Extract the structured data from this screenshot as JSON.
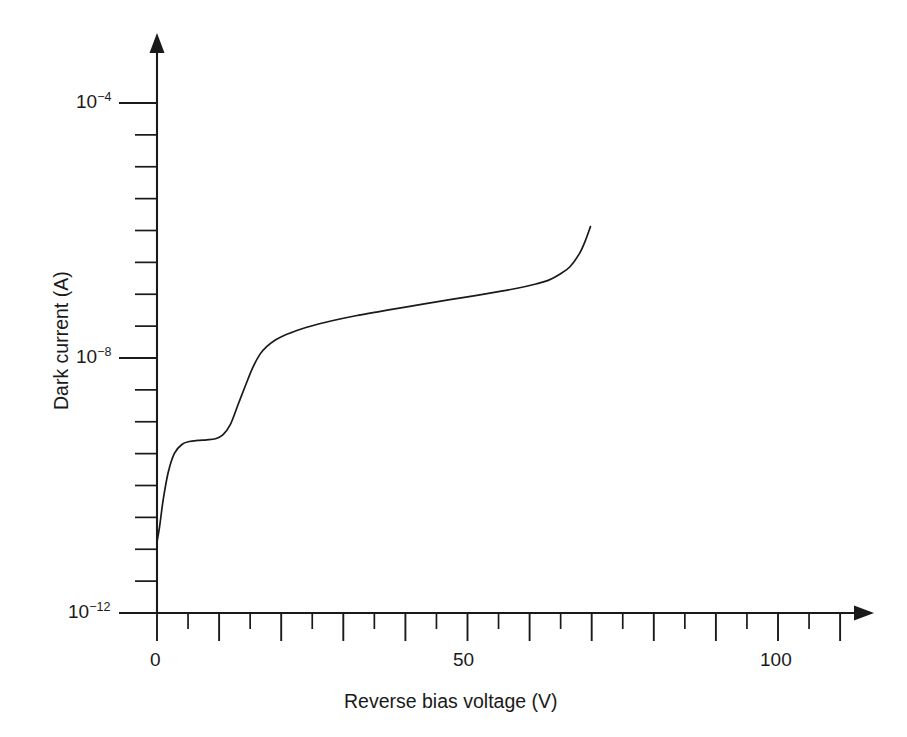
{
  "figure": {
    "background_color": "#ffffff",
    "line_color": "#1a1a1a",
    "width": 907,
    "height": 737
  },
  "chart_data": {
    "type": "line",
    "title": "",
    "subtitle": "",
    "xlabel": "Reverse bias voltage (V)",
    "ylabel": "Dark current (A)",
    "xscale": "linear",
    "yscale": "log",
    "xlim": [
      0,
      115
    ],
    "ylim": [
      1e-12,
      0.001
    ],
    "grid": false,
    "legend": null,
    "x_major_tick_labels": [
      "0",
      "50",
      "100"
    ],
    "x_major_tick_values": [
      0,
      50,
      100
    ],
    "x_tick_interval_major": 10,
    "x_tick_interval_minor": 5,
    "y_major_tick_labels": [
      "10⁻⁴",
      "10⁻⁸",
      "10⁻¹²"
    ],
    "y_major_tick_values": [
      0.0001,
      1e-08,
      1e-12
    ],
    "y_minor_tick_decades": [
      1e-05,
      1e-06,
      1e-07,
      1e-09,
      1e-10,
      1e-11
    ],
    "y_tick_per_decade": 1,
    "series": [
      {
        "name": "Dark current",
        "x": [
          0,
          0.4,
          1.0,
          1.8,
          2.8,
          4.0,
          5.2,
          6.6,
          8.0,
          9.4,
          10.6,
          11.8,
          13.0,
          14.2,
          15.4,
          16.6,
          17.8,
          19.0,
          20.2,
          21.6,
          23.0,
          25.0,
          28.0,
          32.0,
          36.0,
          40.0,
          45.0,
          50.0,
          55.0,
          58.0,
          61.0,
          63.0,
          65.0,
          66.5,
          68.0,
          69.0,
          69.8
        ],
        "y": [
          1.3e-11,
          2.2e-11,
          6e-11,
          1.6e-10,
          3.2e-10,
          4.4e-10,
          4.9e-10,
          5.1e-10,
          5.2e-10,
          5.4e-10,
          6.2e-10,
          9e-10,
          1.8e-09,
          3.6e-09,
          7e-09,
          1.15e-08,
          1.55e-08,
          1.9e-08,
          2.2e-08,
          2.5e-08,
          2.8e-08,
          3.2e-08,
          3.8e-08,
          4.6e-08,
          5.4e-08,
          6.3e-08,
          7.6e-08,
          9.1e-08,
          1.1e-07,
          1.24e-07,
          1.45e-07,
          1.65e-07,
          2.1e-07,
          2.7e-07,
          4.3e-07,
          7e-07,
          1.15e-06
        ]
      }
    ]
  },
  "axis_labels": {
    "x_title": "Reverse bias voltage (V)",
    "y_title": "Dark current (A)",
    "x_ticks": [
      {
        "label": "0",
        "value": 0
      },
      {
        "label": "50",
        "value": 50
      },
      {
        "label": "100",
        "value": 100
      }
    ],
    "y_ticks": [
      {
        "mantissa": "10",
        "exponent": "−4",
        "value": 0.0001
      },
      {
        "mantissa": "10",
        "exponent": "−8",
        "value": 1e-08
      },
      {
        "mantissa": "10",
        "exponent": "−12",
        "value": 1e-12
      }
    ]
  }
}
